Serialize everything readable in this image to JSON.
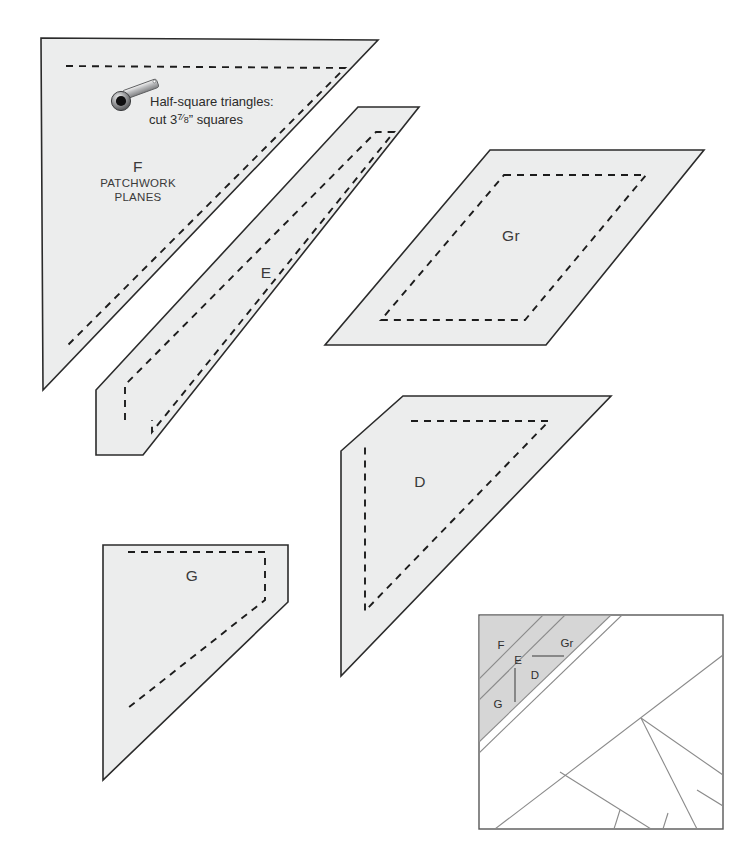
{
  "sheet": {
    "width": 742,
    "height": 859,
    "background": "#ffffff",
    "piece_fill": "#eceded",
    "edge_color": "#2b2b2b",
    "seam_color": "#1c1c1c",
    "block_shade": "#d6d6d6"
  },
  "note": {
    "icon": "bobbin-pin-icon",
    "line1": "Half-square triangles:",
    "line2_prefix": "cut 3",
    "line2_fraction_numerator": "7",
    "line2_fraction_denominator": "8",
    "line2_suffix": "” squares",
    "line2_plain": "cut 3⅞” squares"
  },
  "brand": {
    "line1": "PATCHWORK",
    "line2": "PLANES"
  },
  "templates": [
    {
      "id": "template-f",
      "label": "F",
      "shape": "right-triangle",
      "label_x": 138,
      "label_y": 172,
      "outline": "41,38 378,40 43,390",
      "seam": "66,66 345,68 68,345"
    },
    {
      "id": "template-e",
      "label": "E",
      "shape": "parallelogram",
      "label_x": 266,
      "label_y": 278,
      "outline": "358,107 419,107 143,455 96,455 96,390",
      "seam": "125,420 125,385 376,132 394,132 152,432 152,420"
    },
    {
      "id": "template-gr",
      "label": "Gr",
      "shape": "parallelogram",
      "label_x": 511,
      "label_y": 241,
      "outline": "490,150 704,150 546,345 325,345",
      "seam": "504,175 646,175 525,320 381,320"
    },
    {
      "id": "template-g",
      "label": "G",
      "shape": "parallelogram",
      "label_x": 192,
      "label_y": 581,
      "outline": "103,545 288,545 288,602 103,780",
      "seam": "128,552 265,552 265,600 128,708"
    },
    {
      "id": "template-d",
      "label": "D",
      "shape": "trapezoid",
      "label_x": 420,
      "label_y": 487,
      "outline": "403,396 611,396 341,676 341,451",
      "seam": "411,421 549,421 365,611 365,446"
    }
  ],
  "block_diagram": {
    "name": "pieced-block-diagram",
    "x": 479,
    "y": 615,
    "width": 244,
    "height": 214,
    "shaded_region": "corner-strip",
    "labels": [
      {
        "text": "F",
        "x": 501,
        "y": 649
      },
      {
        "text": "Gr",
        "x": 567,
        "y": 647
      },
      {
        "text": "E",
        "x": 518,
        "y": 664
      },
      {
        "text": "D",
        "x": 535,
        "y": 679
      },
      {
        "text": "G",
        "x": 498,
        "y": 708
      }
    ],
    "leaders": [
      {
        "name": "leader-gr",
        "x1": 532,
        "y1": 656,
        "x2": 564,
        "y2": 656
      },
      {
        "name": "leader-e",
        "x1": 515,
        "y1": 668,
        "x2": 515,
        "y2": 702
      }
    ]
  }
}
